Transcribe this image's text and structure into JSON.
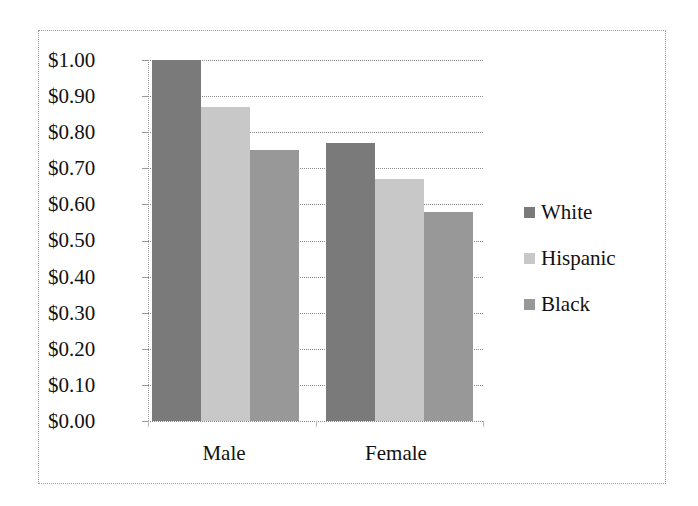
{
  "chart_data": {
    "type": "bar",
    "title": "",
    "xlabel": "",
    "ylabel": "",
    "categories": [
      "Male",
      "Female"
    ],
    "series": [
      {
        "name": "White",
        "values": [
          1.0,
          0.77
        ],
        "color": "#7a7a7a"
      },
      {
        "name": "Hispanic",
        "values": [
          0.87,
          0.67
        ],
        "color": "#c8c8c8"
      },
      {
        "name": "Black",
        "values": [
          0.75,
          0.58
        ],
        "color": "#989898"
      }
    ],
    "ylim": [
      0,
      1.0
    ],
    "y_ticks": [
      "$1.00",
      "$0.90",
      "$0.80",
      "$0.70",
      "$0.60",
      "$0.50",
      "$0.40",
      "$0.30",
      "$0.20",
      "$0.10",
      "$0.00"
    ],
    "grid": true,
    "legend_position": "right"
  },
  "axis": {
    "y_labels": [
      "$1.00",
      "$0.90",
      "$0.80",
      "$0.70",
      "$0.60",
      "$0.50",
      "$0.40",
      "$0.30",
      "$0.20",
      "$0.10",
      "$0.00"
    ],
    "x_labels": [
      "Male",
      "Female"
    ]
  },
  "legend": {
    "items": [
      {
        "label": "White",
        "color": "#7a7a7a"
      },
      {
        "label": "Hispanic",
        "color": "#c8c8c8"
      },
      {
        "label": "Black",
        "color": "#989898"
      }
    ]
  }
}
